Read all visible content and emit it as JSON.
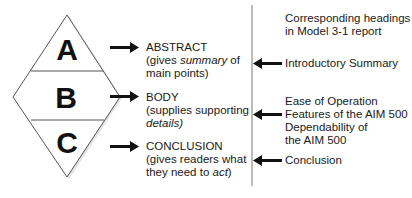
{
  "diamond": {
    "letters": [
      "A",
      "B",
      "C"
    ]
  },
  "left_labels": [
    {
      "heading": "ABSTRACT",
      "line2_pre": "(gives ",
      "line2_em": "summary",
      "line2_post": " of",
      "line3": "main points)"
    },
    {
      "heading": "BODY",
      "line2": "(supplies supporting",
      "line3_em": "details",
      "line3_post": ")"
    },
    {
      "heading": "CONCLUSION",
      "line2": "(gives readers what",
      "line3_pre": "they need to ",
      "line3_em": "act",
      "line3_post": ")"
    }
  ],
  "right_column": {
    "title_line1": "Corresponding headings",
    "title_line2": "in Model 3-1 report",
    "headings": [
      {
        "lines": [
          "Introductory Summary"
        ]
      },
      {
        "lines": [
          "Ease of Operation",
          "Features of the AIM 500",
          "Dependability of",
          "the AIM 500"
        ]
      },
      {
        "lines": [
          "Conclusion"
        ]
      }
    ]
  },
  "colors": {
    "line": "#555555",
    "arrow": "#111111",
    "text": "#1a1a1a"
  }
}
